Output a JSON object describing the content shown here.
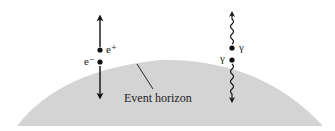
{
  "diagram": {
    "horizon": {
      "label": "Event horizon",
      "fill": "#d4d4d4"
    },
    "pair_left": {
      "type": "electron-positron",
      "outgoing_label": "e⁺",
      "infalling_label": "e⁻",
      "arrow_style": "straight"
    },
    "pair_right": {
      "type": "photon-photon",
      "outgoing_label": "γ",
      "infalling_label": "γ",
      "arrow_style": "wavy"
    },
    "colors": {
      "ink": "#111111",
      "horizon_fill": "#d4d4d4"
    }
  }
}
